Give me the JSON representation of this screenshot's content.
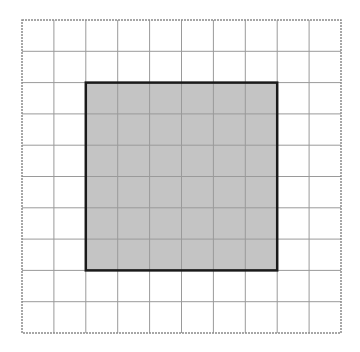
{
  "diagram": {
    "type": "grid-with-shaded-square",
    "grid": {
      "columns": 10,
      "rows": 10,
      "line_color": "#9a9a9a",
      "border_color": "#8a8a8a",
      "background": "#ffffff"
    },
    "shaded_square": {
      "start_column": 2,
      "start_row": 2,
      "width_cells": 6,
      "height_cells": 6,
      "fill": "#c4c4c4",
      "stroke": "#1a1a1a",
      "stroke_width": 2.5
    }
  }
}
